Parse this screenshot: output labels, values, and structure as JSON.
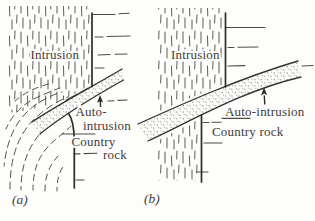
{
  "figure": {
    "type": "geological-sketch-two-panels",
    "panel_a": {
      "caption": "(a)",
      "intrusion_label": "Intrusion",
      "auto_intrusion_label_line1": "Auto-",
      "auto_intrusion_label_line2": "intrusion",
      "country_rock_label_line1": "Country",
      "country_rock_label_line2": "rock"
    },
    "panel_b": {
      "caption": "(b)",
      "intrusion_label": "Intrusion",
      "auto_intrusion_label": "Auto-intrusion",
      "country_rock_label": "Country rock"
    },
    "colors": {
      "background": "#fdfdfc",
      "main_line": "#35322f",
      "fabric_dash": "#55524e",
      "stipple_dot": "#767370",
      "text": "#3f3c38"
    }
  }
}
